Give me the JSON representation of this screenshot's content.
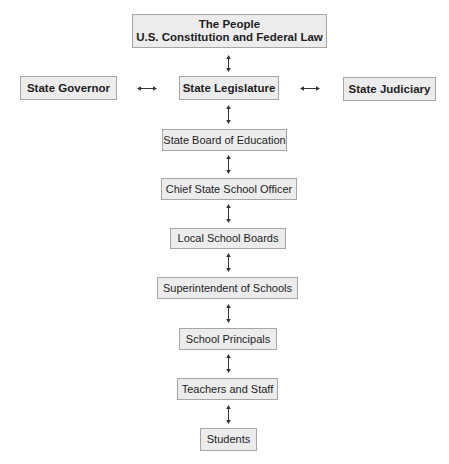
{
  "diagram": {
    "type": "hierarchy-chart",
    "top": {
      "line1": "The People",
      "line2": "U.S. Constitution and Federal Law"
    },
    "branch_row": {
      "left": "State Governor",
      "center": "State Legislature",
      "right": "State Judiciary"
    },
    "chain": [
      "State Board of Education",
      "Chief State School Officer",
      "Local School Boards",
      "Superintendent of Schools",
      "School Principals",
      "Teachers and Staff",
      "Students"
    ],
    "connector": "bidirectional-arrow",
    "colors": {
      "box_fill": "#ececec",
      "box_border": "#a6a6a6",
      "text": "#1e1e1e",
      "arrow": "#333333"
    }
  }
}
